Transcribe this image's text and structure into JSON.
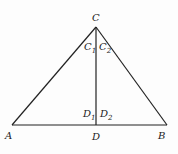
{
  "diagram": {
    "type": "triangle-with-altitude",
    "points": {
      "C": {
        "label": "C",
        "x": 96,
        "y": 27
      },
      "A": {
        "label": "A",
        "x": 12,
        "y": 125
      },
      "B": {
        "label": "B",
        "x": 167,
        "y": 125
      },
      "D": {
        "label": "D",
        "x": 96,
        "y": 125
      }
    },
    "angle_labels": {
      "C1": {
        "base": "C",
        "sub": "1"
      },
      "C2": {
        "base": "C",
        "sub": "2"
      },
      "D1": {
        "base": "D",
        "sub": "1"
      },
      "D2": {
        "base": "D",
        "sub": "2"
      }
    },
    "segments": [
      "AC",
      "BC",
      "AB",
      "CD"
    ],
    "stroke_color": "#222222"
  }
}
